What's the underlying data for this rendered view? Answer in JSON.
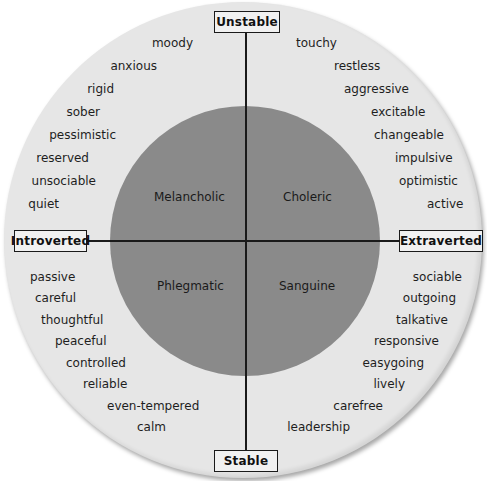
{
  "diagram": {
    "axes": {
      "top": "Unstable",
      "bottom": "Stable",
      "left": "Introverted",
      "right": "Extraverted"
    },
    "temperaments": {
      "top_left": "Melancholic",
      "top_right": "Choleric",
      "bottom_left": "Phlegmatic",
      "bottom_right": "Sanguine"
    },
    "traits": {
      "unstable_introverted": [
        "moody",
        "anxious",
        "rigid",
        "sober",
        "pessimistic",
        "reserved",
        "unsociable",
        "quiet"
      ],
      "unstable_extraverted": [
        "touchy",
        "restless",
        "aggressive",
        "excitable",
        "changeable",
        "impulsive",
        "optimistic",
        "active"
      ],
      "stable_introverted": [
        "passive",
        "careful",
        "thoughtful",
        "peaceful",
        "controlled",
        "reliable",
        "even-tempered",
        "calm"
      ],
      "stable_extraverted": [
        "sociable",
        "outgoing",
        "talkative",
        "responsive",
        "easygoing",
        "lively",
        "carefree",
        "leadership"
      ]
    },
    "colors": {
      "outer_ring": "#e6e6e6",
      "inner_circle": "#8a8a8a",
      "lines": "#1a1a1a",
      "label_box": "#f1f1f1"
    }
  }
}
